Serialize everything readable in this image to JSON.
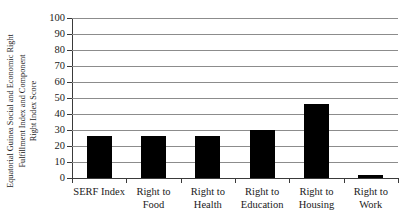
{
  "chart_data": {
    "type": "bar",
    "title": "",
    "subtitle": "",
    "xlabel": "",
    "ylabel": "Equatorial Guinea Social and Economic Right Fulfillment Index and Component Right Index Score",
    "ylabel_lines": [
      "Equatorial Guinea Social and Economic Right",
      "Fulfillment Index and Component",
      "Right Index Score"
    ],
    "categories": [
      "SERF Index",
      "Right to Food",
      "Right to Health",
      "Right to Education",
      "Right to Housing",
      "Right to Work"
    ],
    "category_lines": [
      [
        "SERF Index"
      ],
      [
        "Right to",
        "Food"
      ],
      [
        "Right to",
        "Health"
      ],
      [
        "Right to",
        "Education"
      ],
      [
        "Right to",
        "Housing"
      ],
      [
        "Right to",
        "Work"
      ]
    ],
    "values": [
      26,
      26,
      26,
      30,
      46,
      2
    ],
    "ylim": [
      0,
      100
    ],
    "ytick_step": 10,
    "yticks": [
      0,
      10,
      20,
      30,
      40,
      50,
      60,
      70,
      80,
      90,
      100
    ],
    "ytick_labels": [
      "0",
      "10",
      "20",
      "30",
      "40",
      "50",
      "60",
      "70",
      "80",
      "90",
      "100"
    ],
    "grid": true,
    "grid_axis": "y",
    "legend": false,
    "legend_position": "none",
    "bar_color": "#000000",
    "grid_color": "#8c8c8c",
    "axis_color": "#3a3a3a",
    "background_color": "#ffffff"
  }
}
